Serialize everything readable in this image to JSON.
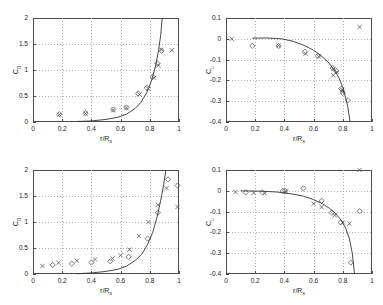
{
  "figure": {
    "width": 383,
    "height": 305,
    "background": "#ffffff",
    "axis_color": "#4d4d4d",
    "grid_color": "#b3b3b3",
    "marker_color": "#595959",
    "curve_color": "#333333"
  },
  "chart_data": [
    {
      "id": "top-left",
      "type": "scatter",
      "title": "",
      "xlabel": "r/R",
      "xlabel_sub": "s",
      "ylabel": "C",
      "ylabel_sub": "D",
      "xlim": [
        0,
        1
      ],
      "ylim": [
        0,
        2
      ],
      "xticks": [
        0,
        0.2,
        0.4,
        0.6,
        0.8,
        1
      ],
      "xticklabels": [
        "0",
        "0.2",
        "0.4",
        "0.6",
        "0.8",
        "1"
      ],
      "yticks": [
        0,
        0.5,
        1,
        1.5,
        2
      ],
      "yticklabels": [
        "0",
        "0.5",
        "1",
        "1.5",
        "2"
      ],
      "grid": true,
      "series": [
        {
          "name": "diamond-series",
          "marker": "diamond",
          "x": [
            0.18,
            0.36,
            0.55,
            0.64,
            0.72,
            0.78,
            0.82,
            0.85,
            0.88
          ],
          "y": [
            0.15,
            0.17,
            0.24,
            0.28,
            0.55,
            0.66,
            0.87,
            1.13,
            1.37
          ]
        },
        {
          "name": "cross-series",
          "marker": "cross",
          "x": [
            0.18,
            0.36,
            0.55,
            0.64,
            0.73,
            0.79,
            0.83,
            0.86,
            0.88,
            0.95
          ],
          "y": [
            0.14,
            0.16,
            0.23,
            0.27,
            0.53,
            0.64,
            0.85,
            1.09,
            1.39,
            1.38
          ]
        },
        {
          "name": "fit-curve",
          "marker": "line",
          "x": [
            0.3,
            0.4,
            0.5,
            0.58,
            0.64,
            0.7,
            0.74,
            0.78,
            0.81,
            0.84,
            0.86,
            0.875,
            0.885
          ],
          "y": [
            0.01,
            0.02,
            0.05,
            0.09,
            0.15,
            0.26,
            0.38,
            0.57,
            0.78,
            1.08,
            1.38,
            1.68,
            2.0
          ]
        }
      ]
    },
    {
      "id": "top-right",
      "type": "scatter",
      "title": "",
      "xlabel": "r/R",
      "xlabel_sub": "s",
      "ylabel": "C",
      "ylabel_sub": "L",
      "xlim": [
        0,
        1
      ],
      "ylim": [
        -0.4,
        0.1
      ],
      "xticks": [
        0,
        0.2,
        0.4,
        0.6,
        0.8,
        1
      ],
      "xticklabels": [
        "0",
        "0.2",
        "0.4",
        "0.6",
        "0.8",
        "1"
      ],
      "yticks": [
        -0.4,
        -0.3,
        -0.2,
        -0.1,
        0,
        0.1
      ],
      "yticklabels": [
        "-0.4",
        "-0.3",
        "-0.2",
        "-0.1",
        "0",
        "0.1"
      ],
      "grid": true,
      "series": [
        {
          "name": "diamond-series",
          "marker": "diamond",
          "x": [
            0.18,
            0.36,
            0.54,
            0.63,
            0.73,
            0.755,
            0.79,
            0.8,
            0.835
          ],
          "y": [
            -0.034,
            -0.035,
            -0.063,
            -0.082,
            -0.14,
            -0.155,
            -0.24,
            -0.26,
            -0.295
          ]
        },
        {
          "name": "cross-series",
          "marker": "cross",
          "x": [
            0.04,
            0.36,
            0.545,
            0.635,
            0.735,
            0.76,
            0.795,
            0.8,
            0.735,
            0.915
          ],
          "y": [
            0.0,
            -0.033,
            -0.072,
            -0.085,
            -0.145,
            -0.16,
            -0.245,
            -0.255,
            -0.175,
            0.057
          ]
        },
        {
          "name": "fit-curve",
          "marker": "line",
          "x": [
            0.18,
            0.28,
            0.38,
            0.46,
            0.54,
            0.6,
            0.65,
            0.7,
            0.74,
            0.775,
            0.8,
            0.82,
            0.835,
            0.85
          ],
          "y": [
            0.003,
            0.004,
            0.0,
            -0.012,
            -0.033,
            -0.055,
            -0.08,
            -0.112,
            -0.148,
            -0.19,
            -0.235,
            -0.285,
            -0.33,
            -0.4
          ]
        }
      ]
    },
    {
      "id": "bottom-left",
      "type": "scatter",
      "title": "",
      "xlabel": "r/R",
      "xlabel_sub": "s",
      "ylabel": "C",
      "ylabel_sub": "D",
      "xlim": [
        0,
        1
      ],
      "ylim": [
        0,
        2
      ],
      "xticks": [
        0,
        0.2,
        0.4,
        0.6,
        0.8,
        1
      ],
      "xticklabels": [
        "0",
        "0.2",
        "0.4",
        "0.6",
        "0.8",
        "1"
      ],
      "yticks": [
        0,
        0.5,
        1,
        1.5,
        2
      ],
      "yticklabels": [
        "0",
        "0.5",
        "1",
        "1.5",
        "2"
      ],
      "grid": true,
      "series": [
        {
          "name": "diamond-series",
          "marker": "diamond",
          "x": [
            0.135,
            0.265,
            0.4,
            0.53,
            0.655,
            0.785,
            0.855,
            0.925,
            0.99
          ],
          "y": [
            0.175,
            0.2,
            0.22,
            0.245,
            0.33,
            0.68,
            1.18,
            1.82,
            1.7
          ]
        },
        {
          "name": "cross-series",
          "marker": "cross",
          "x": [
            0.065,
            0.175,
            0.3,
            0.425,
            0.545,
            0.6,
            0.66,
            0.725,
            0.79,
            0.855,
            0.915,
            0.99
          ],
          "y": [
            0.155,
            0.215,
            0.255,
            0.28,
            0.3,
            0.36,
            0.47,
            0.73,
            1.0,
            1.33,
            1.65,
            1.29
          ]
        },
        {
          "name": "fit-curve",
          "marker": "line",
          "x": [
            0.3,
            0.4,
            0.5,
            0.58,
            0.64,
            0.7,
            0.745,
            0.785,
            0.82,
            0.85,
            0.875,
            0.895,
            0.91
          ],
          "y": [
            0.005,
            0.02,
            0.05,
            0.09,
            0.15,
            0.26,
            0.38,
            0.57,
            0.8,
            1.1,
            1.42,
            1.72,
            2.0
          ]
        }
      ]
    },
    {
      "id": "bottom-right",
      "type": "scatter",
      "title": "",
      "xlabel": "r/R",
      "xlabel_sub": "s",
      "ylabel": "C",
      "ylabel_sub": "L",
      "xlim": [
        0,
        1
      ],
      "ylim": [
        -0.4,
        0.1
      ],
      "xticks": [
        0,
        0.2,
        0.4,
        0.6,
        0.8,
        1
      ],
      "xticklabels": [
        "0",
        "0.2",
        "0.4",
        "0.6",
        "0.8",
        "1"
      ],
      "yticks": [
        -0.4,
        -0.3,
        -0.2,
        -0.1,
        0,
        0.1
      ],
      "yticklabels": [
        "-0.4",
        "-0.3",
        "-0.2",
        "-0.1",
        "0",
        "0.1"
      ],
      "grid": true,
      "series": [
        {
          "name": "diamond-series",
          "marker": "diamond",
          "x": [
            0.135,
            0.25,
            0.39,
            0.405,
            0.53,
            0.655,
            0.725,
            0.785,
            0.855,
            0.915
          ],
          "y": [
            -0.008,
            -0.008,
            0.0,
            0.0,
            0.012,
            -0.048,
            -0.105,
            -0.152,
            -0.345,
            -0.098
          ]
        },
        {
          "name": "cross-series",
          "marker": "cross",
          "x": [
            0.065,
            0.19,
            0.265,
            0.41,
            0.6,
            0.655,
            0.745,
            0.8,
            0.845,
            0.915
          ],
          "y": [
            -0.006,
            -0.01,
            -0.012,
            -0.003,
            -0.062,
            -0.078,
            -0.118,
            -0.152,
            -0.158,
            0.1
          ]
        },
        {
          "name": "fit-curve",
          "marker": "line",
          "x": [
            0.1,
            0.25,
            0.35,
            0.45,
            0.53,
            0.6,
            0.66,
            0.71,
            0.755,
            0.79,
            0.82,
            0.845,
            0.865,
            0.88
          ],
          "y": [
            0.0,
            -0.002,
            -0.006,
            -0.015,
            -0.026,
            -0.042,
            -0.062,
            -0.085,
            -0.112,
            -0.143,
            -0.18,
            -0.23,
            -0.3,
            -0.4
          ]
        }
      ]
    }
  ]
}
